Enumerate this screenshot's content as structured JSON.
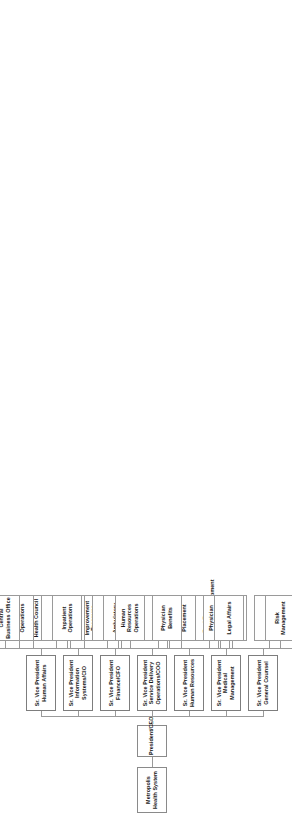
{
  "chart_meta": {
    "type": "organization-chart",
    "orientation": "rotated-90-ccw",
    "title": "Metropolis Health System Organization Chart"
  },
  "root": {
    "label": "Metropolis Health System"
  },
  "ceo": {
    "label": "President/CEO"
  },
  "divisions": [
    {
      "id": "human-affairs",
      "label": "Sr. Vice President Human Affairs",
      "departments": [
        {
          "label": "Community Outreach"
        },
        {
          "label": "Community Health Council"
        },
        {
          "label": "Community Health Improvement Programs"
        }
      ]
    },
    {
      "id": "information-systems",
      "label": "Sr. Vice President Information Systems/CIO",
      "departments": [
        {
          "label": "Info Systems Operations"
        },
        {
          "label": "Data Management"
        },
        {
          "label": "Info Systems Development"
        }
      ]
    },
    {
      "id": "finance",
      "label": "Sr. Vice President Finance/CFO",
      "departments": [
        {
          "label": "Central Business Office"
        },
        {
          "label": "Finance"
        },
        {
          "label": "Insurance"
        },
        {
          "label": "Managed Care"
        },
        {
          "label": "Real Estate Facilities/Development"
        }
      ]
    },
    {
      "id": "service-delivery",
      "label": "Sr. Vice President Service Delivery Operations/COO",
      "departments": [
        {
          "label": "Inpatient Operations"
        },
        {
          "label": "Ambulatory Operations"
        },
        {
          "label": "Other Operations"
        },
        {
          "label": "Operations TQI"
        }
      ]
    },
    {
      "id": "human-resources",
      "label": "Sr. Vice President Human Resources",
      "departments": [
        {
          "label": "Human Resources Operations"
        },
        {
          "label": "HR Planning & Placement"
        },
        {
          "label": "Learning Services"
        }
      ]
    },
    {
      "id": "medical-management",
      "label": "Sr. Vice President Medical Management",
      "departments": [
        {
          "label": "Physician Benefits"
        },
        {
          "label": "Physician Recruitment & Integration"
        },
        {
          "label": "Physician TQI"
        }
      ]
    },
    {
      "id": "general-counsel",
      "label": "Sr. Vice President General Counsel",
      "departments": [
        {
          "label": "Legal Affairs"
        },
        {
          "label": "Risk Management"
        }
      ]
    }
  ],
  "colors": {
    "box_border": "#888888",
    "line": "#9a9a9a",
    "background": "#ffffff",
    "text": "#1a1a1a"
  }
}
